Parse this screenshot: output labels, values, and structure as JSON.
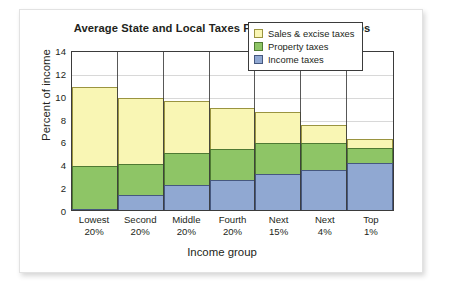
{
  "card": {
    "title": "Average State and Local Taxes Paid by Income Groups"
  },
  "chart_data": {
    "type": "bar",
    "subtype": "stacked-bar",
    "title": "Average State and Local Taxes Paid by Income Groups",
    "xlabel": "Income group",
    "ylabel": "Percent of income",
    "ylim": [
      0,
      14
    ],
    "yticks": [
      0,
      2,
      4,
      6,
      8,
      10,
      12,
      14
    ],
    "grid": true,
    "legend_position": "top-right",
    "categories": [
      "Lowest\n20%",
      "Second\n20%",
      "Middle\n20%",
      "Fourth\n20%",
      "Next\n15%",
      "Next\n4%",
      "Top\n1%"
    ],
    "category_lines": [
      [
        "Lowest",
        "20%"
      ],
      [
        "Second",
        "20%"
      ],
      [
        "Middle",
        "20%"
      ],
      [
        "Fourth",
        "20%"
      ],
      [
        "Next",
        "15%"
      ],
      [
        "Next",
        "4%"
      ],
      [
        "Top",
        "1%"
      ]
    ],
    "series": [
      {
        "name": "Income taxes",
        "key": "income",
        "color": "#90a8d2",
        "values": [
          0.2,
          1.4,
          2.3,
          2.7,
          3.2,
          3.6,
          4.2
        ]
      },
      {
        "name": "Property taxes",
        "key": "property",
        "color": "#8ec566",
        "values": [
          3.8,
          2.8,
          2.9,
          2.8,
          2.8,
          2.4,
          1.4
        ]
      },
      {
        "name": "Sales & excise taxes",
        "key": "sales",
        "color": "#f9f6b4",
        "values": [
          7.0,
          5.9,
          4.6,
          3.7,
          2.8,
          1.7,
          0.9
        ]
      }
    ],
    "totals": [
      11.0,
      10.1,
      9.8,
      9.2,
      8.8,
      7.7,
      6.5
    ],
    "legend_order": [
      "Sales & excise taxes",
      "Property taxes",
      "Income taxes"
    ],
    "colors": {
      "sales": "#f9f6b4",
      "property": "#8ec566",
      "income": "#90a8d2",
      "axis": "#3b3b3b",
      "grid": "#d8d8d8",
      "text": "#231f20"
    }
  }
}
